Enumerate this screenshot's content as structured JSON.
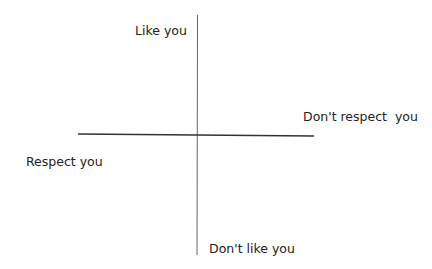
{
  "diagram": {
    "type": "quadrant",
    "axes": {
      "vertical": {
        "top_label": "Like you",
        "bottom_label": "Don't like you"
      },
      "horizontal": {
        "left_label": "Respect you",
        "right_label": "Don't respect  you"
      }
    },
    "line_color": "#333333"
  }
}
